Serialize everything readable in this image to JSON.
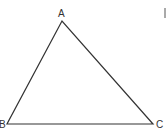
{
  "diagram": {
    "type": "triangle",
    "stroke_color": "#333333",
    "vertices": [
      {
        "label": "A",
        "x": 62,
        "y": 21,
        "label_x": 58,
        "label_y": 17
      },
      {
        "label": "B",
        "x": 7,
        "y": 124,
        "label_x": -1,
        "label_y": 128
      },
      {
        "label": "C",
        "x": 153,
        "y": 124,
        "label_x": 156,
        "label_y": 128
      }
    ],
    "edge_mark": {
      "x": 165,
      "y1": 8,
      "y2": 18
    }
  }
}
